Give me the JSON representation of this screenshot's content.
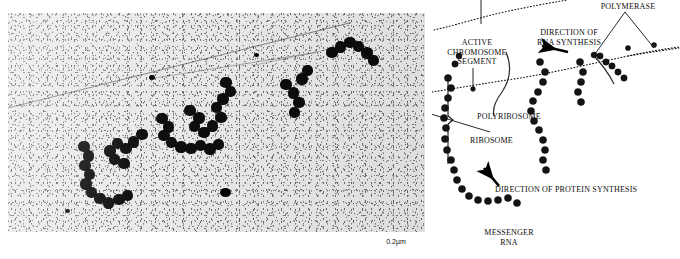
{
  "figure": {
    "panels": [
      {
        "id": "micrograph",
        "kind": "electron-micrograph",
        "scale_bar": {
          "label": "0.2µm",
          "value": 0.2,
          "unit": "µm"
        }
      },
      {
        "id": "diagram",
        "kind": "interpretive-line-drawing"
      }
    ]
  },
  "diagram": {
    "labels": {
      "polymerase": "POLYMERASE",
      "direction_rna_synthesis": "DIRECTION OF\nRNA SYNTHESIS",
      "active_chromosome_segment": "ACTIVE\nCHROMOSOME\nSEGMENT",
      "polyribosome": "POLYRIBOSOME",
      "ribosome": "RIBOSOME",
      "direction_protein_synthesis": "DIRECTION OF PROTEIN SYNTHESIS",
      "messenger_rna": "MESSENGER\nRNA"
    }
  },
  "colors": {
    "ink": "#000000",
    "paper": "#ffffff",
    "micrograph_field": "#eaeaea",
    "micrograph_particles": "#000000"
  }
}
